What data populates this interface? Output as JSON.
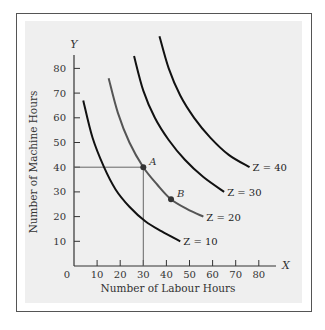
{
  "chart_data": {
    "type": "line",
    "title": "",
    "xlabel": "Number of Labour Hours",
    "ylabel": "Number of Machine Hours",
    "x_axis_letter": "X",
    "y_axis_letter": "Y",
    "origin_label": "0",
    "xlim": [
      0,
      85
    ],
    "ylim": [
      0,
      88
    ],
    "x_ticks": [
      10,
      20,
      30,
      40,
      50,
      60,
      70,
      80
    ],
    "y_ticks": [
      10,
      20,
      30,
      40,
      50,
      60,
      70,
      80
    ],
    "grid": false,
    "legend": "none (curves labelled inline)",
    "series": [
      {
        "name": "Z = 10",
        "color": "#111111",
        "points": [
          [
            4,
            67
          ],
          [
            8,
            52
          ],
          [
            13,
            40
          ],
          [
            18,
            31
          ],
          [
            24,
            24
          ],
          [
            31,
            18
          ],
          [
            38,
            14
          ],
          [
            46,
            10
          ]
        ]
      },
      {
        "name": "Z = 20",
        "color": "#555555",
        "points": [
          [
            15,
            76
          ],
          [
            19,
            62
          ],
          [
            24,
            50
          ],
          [
            30,
            40
          ],
          [
            36,
            33
          ],
          [
            42,
            27
          ],
          [
            49,
            23
          ],
          [
            56,
            20
          ]
        ]
      },
      {
        "name": "Z = 30",
        "color": "#111111",
        "points": [
          [
            26,
            85
          ],
          [
            30,
            71
          ],
          [
            35,
            60
          ],
          [
            41,
            51
          ],
          [
            48,
            43
          ],
          [
            56,
            36
          ],
          [
            65,
            30
          ]
        ]
      },
      {
        "name": "Z = 40",
        "color": "#111111",
        "points": [
          [
            37,
            93
          ],
          [
            41,
            80
          ],
          [
            46,
            69
          ],
          [
            52,
            60
          ],
          [
            59,
            52
          ],
          [
            67,
            45
          ],
          [
            76,
            40
          ]
        ]
      }
    ],
    "annotations": [
      {
        "label": "A",
        "x": 30,
        "y": 40,
        "on_series": "Z = 20",
        "guide_lines": true
      },
      {
        "label": "B",
        "x": 42,
        "y": 27,
        "on_series": "Z = 20",
        "guide_lines": false
      }
    ]
  }
}
